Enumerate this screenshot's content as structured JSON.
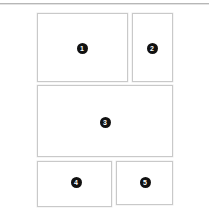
{
  "canvas": {
    "width": 209,
    "height": 220,
    "background_color": "#ffffff",
    "border_color": "#c9c9c9",
    "badge_color": "#111111",
    "badge_text_color": "#ffffff",
    "rule_color": "#b7b7b7"
  },
  "divider": {
    "name": "top-divider"
  },
  "regions": [
    {
      "label": "1",
      "name": "region-1",
      "x": 37,
      "y": 13,
      "width": 91,
      "height": 69,
      "badge_x": 82,
      "badge_y": 48
    },
    {
      "label": "2",
      "name": "region-2",
      "x": 132,
      "y": 13,
      "width": 41,
      "height": 69,
      "badge_x": 152,
      "badge_y": 48
    },
    {
      "label": "3",
      "name": "region-3",
      "x": 37,
      "y": 85,
      "width": 136,
      "height": 72,
      "badge_x": 105,
      "badge_y": 122
    },
    {
      "label": "4",
      "name": "region-4",
      "x": 37,
      "y": 161,
      "width": 75,
      "height": 46,
      "badge_x": 76,
      "badge_y": 182
    },
    {
      "label": "5",
      "name": "region-5",
      "x": 116,
      "y": 161,
      "width": 57,
      "height": 44,
      "badge_x": 145,
      "badge_y": 182
    }
  ]
}
